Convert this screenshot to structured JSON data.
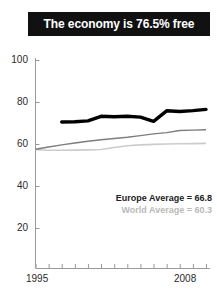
{
  "title": {
    "text": "The economy is 76.5% free"
  },
  "legend": {
    "europe": "Europe Average = 66.8",
    "world": "World Average = 60.3"
  },
  "axis": {
    "x_start_label": "1995",
    "x_end_label": "2008",
    "y_labels": [
      "100",
      "80",
      "60",
      "40",
      "20"
    ]
  },
  "colors": {
    "banner_bg": "#111111",
    "banner_text": "#ffffff",
    "country_line": "#000000",
    "europe_line": "#7d7d7d",
    "world_line": "#cccccc",
    "axis": "#9a9a9a"
  },
  "chart_data": {
    "type": "line",
    "title": "The economy is 76.5% free",
    "xlabel": "",
    "ylabel": "",
    "xlim": [
      1995,
      2008
    ],
    "ylim": [
      0,
      100
    ],
    "yticks": [
      20,
      40,
      60,
      80,
      100
    ],
    "xticks": [
      1995,
      1996,
      1997,
      1998,
      1999,
      2000,
      2001,
      2002,
      2003,
      2004,
      2005,
      2006,
      2007,
      2008
    ],
    "grid": false,
    "legend_position": "inside-right",
    "x": [
      1995,
      1996,
      1997,
      1998,
      1999,
      2000,
      2001,
      2002,
      2003,
      2004,
      2005,
      2006,
      2007,
      2008
    ],
    "series": [
      {
        "name": "Country",
        "color": "#000000",
        "width": "thick",
        "x": [
          1997,
          1998,
          1999,
          2000,
          2001,
          2002,
          2003,
          2004,
          2005,
          2006,
          2007,
          2008
        ],
        "values": [
          70.5,
          70.6,
          71.0,
          73.2,
          73.0,
          73.2,
          72.8,
          70.8,
          75.8,
          75.5,
          75.9,
          76.5
        ]
      },
      {
        "name": "Europe Average",
        "color": "#7d7d7d",
        "width": "thin",
        "x": [
          1995,
          1996,
          1997,
          1998,
          1999,
          2000,
          2001,
          2002,
          2003,
          2004,
          2005,
          2006,
          2007,
          2008
        ],
        "values": [
          57.5,
          58.6,
          59.6,
          60.5,
          61.3,
          62.0,
          62.6,
          63.2,
          64.0,
          64.8,
          65.4,
          66.4,
          66.6,
          66.8
        ]
      },
      {
        "name": "World Average",
        "color": "#cccccc",
        "width": "thin",
        "x": [
          1995,
          1996,
          1997,
          1998,
          1999,
          2000,
          2001,
          2002,
          2003,
          2004,
          2005,
          2006,
          2007,
          2008
        ],
        "values": [
          57.3,
          57.0,
          57.0,
          57.1,
          57.2,
          57.4,
          58.3,
          59.2,
          59.6,
          59.8,
          60.0,
          60.1,
          60.2,
          60.3
        ]
      }
    ],
    "annotations": [
      "Europe Average = 66.8",
      "World Average = 60.3"
    ]
  }
}
